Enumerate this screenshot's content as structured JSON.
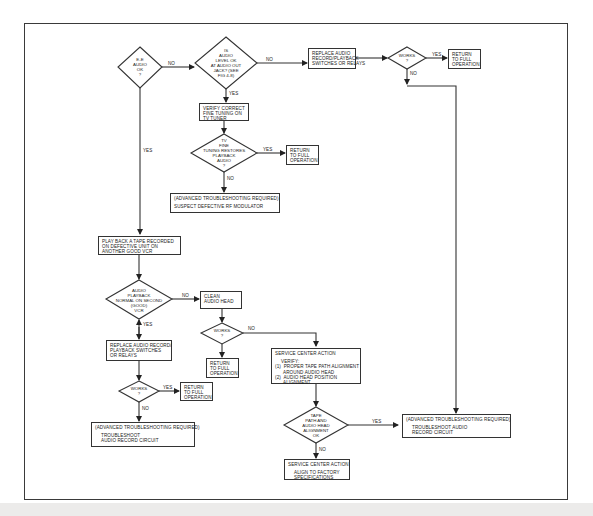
{
  "diagram": {
    "type": "flowchart",
    "colors": {
      "line": "#333333",
      "background": "#ffffff",
      "bottom_band": "#ecebea"
    }
  },
  "nodes": {
    "d_ee_audio": {
      "kind": "decision",
      "lines": [
        "E-E",
        "AUDIO",
        "OK",
        "?"
      ]
    },
    "d_audio_level": {
      "kind": "decision",
      "lines": [
        "IS",
        "AUDIO",
        "LEVEL OK",
        "AT AUDIO OUT",
        "JACK? (SEE",
        "FIG 4-8)"
      ]
    },
    "p_replace_top": {
      "kind": "process",
      "lines": [
        "REPLACE AUDIO",
        "RECORD/PLAYBACK",
        "SWITCHES OR RELAYS"
      ]
    },
    "d_works_top": {
      "kind": "decision",
      "lines": [
        "WORKS",
        "?"
      ]
    },
    "t_return_top": {
      "kind": "terminal",
      "lines": [
        "RETURN",
        "TO FULL",
        "OPERATION"
      ]
    },
    "p_verify_tuning": {
      "kind": "process",
      "lines": [
        "VERIFY CORRECT",
        "FINE TUNING ON",
        "TV TUNER"
      ]
    },
    "d_fine_tuning": {
      "kind": "decision",
      "lines": [
        "TV",
        "FINE",
        "TUNING RESTORES",
        "PLAYBACK",
        "AUDIO",
        "?"
      ]
    },
    "t_return_tuning": {
      "kind": "terminal",
      "lines": [
        "RETURN",
        "TO FULL",
        "OPERATION"
      ]
    },
    "p_adv_rf": {
      "kind": "process",
      "header": "(ADVANCED TROUBLESHOOTING REQUIRED)",
      "lines": [
        "SUSPECT DEFECTIVE RF MODULATOR"
      ]
    },
    "p_play_tape": {
      "kind": "process",
      "lines": [
        "PLAY BACK A TAPE RECORDED",
        "ON DEFECTIVE UNIT ON",
        "ANOTHER GOOD VCR"
      ]
    },
    "d_second_vcr": {
      "kind": "decision",
      "lines": [
        "AUDIO",
        "PLAYBACK",
        "NORMAL ON SECOND",
        "(GOOD)",
        "VCR"
      ]
    },
    "p_clean_head": {
      "kind": "process",
      "lines": [
        "CLEAN",
        "AUDIO HEAD"
      ]
    },
    "d_works_clean": {
      "kind": "decision",
      "lines": [
        "WORKS",
        "?"
      ]
    },
    "t_return_clean": {
      "kind": "terminal",
      "lines": [
        "RETURN",
        "TO FULL",
        "OPERATION"
      ]
    },
    "p_replace_left": {
      "kind": "process",
      "lines": [
        "REPLACE AUDIO RECORD/",
        "PLAYBACK SWITCHES",
        "OR RELAYS"
      ]
    },
    "d_works_left": {
      "kind": "decision",
      "lines": [
        "WORKS",
        "?"
      ]
    },
    "t_return_left": {
      "kind": "terminal",
      "lines": [
        "RETURN",
        "TO FULL",
        "OPERATION"
      ]
    },
    "p_adv_left": {
      "kind": "process",
      "header": "(ADVANCED TROUBLESHOOTING REQUIRED)",
      "lines": [
        "TROUBLESHOOT",
        "AUDIO RECORD CIRCUIT"
      ]
    },
    "p_service_verify": {
      "kind": "process",
      "header": "SERVICE CENTER ACTION",
      "subheader": "VERIFY:",
      "lines": [
        "(1)  PROPER TAPE PATH ALIGNMENT",
        "      AROUND AUDIO HEAD",
        "(2)  AUDIO HEAD POSITION",
        "      ALIGNMENT"
      ]
    },
    "d_tape_path": {
      "kind": "decision",
      "lines": [
        "TAPE",
        "PATH AND",
        "AUDIO HEAD",
        "ALIGNMENT",
        "OK"
      ]
    },
    "p_service_align": {
      "kind": "process",
      "header": "SERVICE CENTER ACTION",
      "lines": [
        "ALIGN TO FACTORY",
        "SPECIFICATIONS"
      ]
    },
    "p_adv_right": {
      "kind": "process",
      "header": "(ADVANCED TROUBLESHOOTING REQUIRED)",
      "lines": [
        "TROUBLESHOOT AUDIO",
        "RECORD CIRCUIT"
      ]
    }
  },
  "edge_labels": {
    "yes": "YES",
    "no": "NO"
  },
  "edges": [
    {
      "from": "d_ee_audio",
      "to": "d_audio_level",
      "label": "NO"
    },
    {
      "from": "d_ee_audio",
      "to": "p_play_tape",
      "label": "YES"
    },
    {
      "from": "d_audio_level",
      "to": "p_replace_top",
      "label": "NO"
    },
    {
      "from": "d_audio_level",
      "to": "p_verify_tuning",
      "label": "YES"
    },
    {
      "from": "p_replace_top",
      "to": "d_works_top",
      "label": ""
    },
    {
      "from": "d_works_top",
      "to": "t_return_top",
      "label": "YES"
    },
    {
      "from": "d_works_top",
      "to": "p_adv_right",
      "label": "NO"
    },
    {
      "from": "p_verify_tuning",
      "to": "d_fine_tuning",
      "label": ""
    },
    {
      "from": "d_fine_tuning",
      "to": "t_return_tuning",
      "label": "YES"
    },
    {
      "from": "d_fine_tuning",
      "to": "p_adv_rf",
      "label": "NO"
    },
    {
      "from": "p_play_tape",
      "to": "d_second_vcr",
      "label": ""
    },
    {
      "from": "d_second_vcr",
      "to": "p_clean_head",
      "label": "NO"
    },
    {
      "from": "d_second_vcr",
      "to": "p_replace_left",
      "label": "YES"
    },
    {
      "from": "p_clean_head",
      "to": "d_works_clean",
      "label": ""
    },
    {
      "from": "d_works_clean",
      "to": "t_return_clean",
      "label": "YES"
    },
    {
      "from": "d_works_clean",
      "to": "p_service_verify",
      "label": "NO"
    },
    {
      "from": "p_replace_left",
      "to": "d_works_left",
      "label": ""
    },
    {
      "from": "d_works_left",
      "to": "t_return_left",
      "label": "YES"
    },
    {
      "from": "d_works_left",
      "to": "p_adv_left",
      "label": "NO"
    },
    {
      "from": "p_service_verify",
      "to": "d_tape_path",
      "label": ""
    },
    {
      "from": "d_tape_path",
      "to": "p_adv_right",
      "label": "YES"
    },
    {
      "from": "d_tape_path",
      "to": "p_service_align",
      "label": "NO"
    }
  ]
}
